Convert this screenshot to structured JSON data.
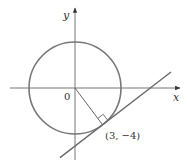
{
  "diagram": {
    "type": "circle-with-tangent-line",
    "axes": {
      "x_label": "x",
      "y_label": "y",
      "origin_label": "0"
    },
    "circle": {
      "center": [
        0,
        0
      ],
      "radius": 5
    },
    "tangent_point": {
      "x": 3,
      "y": -4,
      "label": "(3, −4)"
    },
    "radius_segment": {
      "from": [
        0,
        0
      ],
      "to": [
        3,
        -4
      ]
    },
    "right_angle_marker": true,
    "tangent_line": {
      "slope": "3/4",
      "through": [
        3,
        -4
      ]
    },
    "colors": {
      "axis": "#555555",
      "circle": "#7a7a7a",
      "line": "#6a6a6a",
      "text": "#333333"
    }
  }
}
